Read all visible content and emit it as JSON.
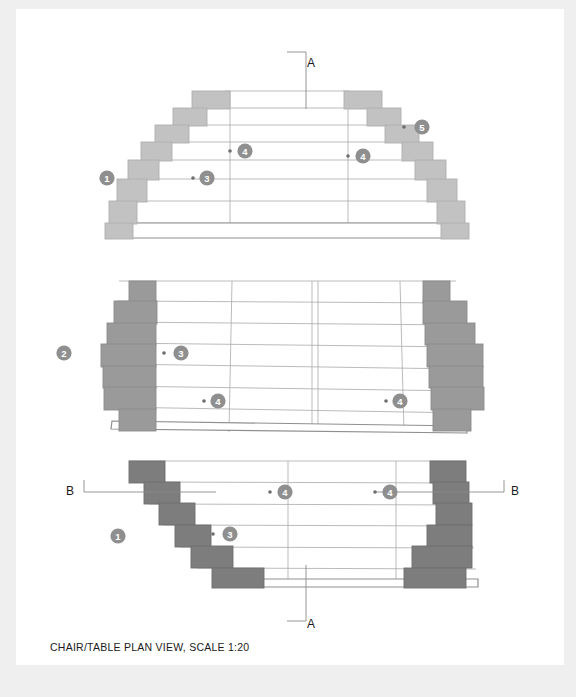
{
  "document": {
    "caption": "CHAIR/TABLE PLAN VIEW, SCALE 1:20",
    "background_color": "#efefef",
    "sheet_color": "#ffffff"
  },
  "section_markers": [
    {
      "label": "A",
      "name": "section-marker-a-top",
      "x": 306,
      "y": 54
    },
    {
      "label": "A",
      "name": "section-marker-a-bottom",
      "x": 306,
      "y": 615
    },
    {
      "label": "B",
      "name": "section-marker-b-left",
      "x": 66,
      "y": 482
    },
    {
      "label": "B",
      "name": "section-marker-b-right",
      "x": 527,
      "y": 482
    }
  ],
  "callouts": [
    {
      "id": "1",
      "name": "callout-1-top",
      "cx": 107,
      "cy": 178,
      "dot": null
    },
    {
      "id": "3",
      "name": "callout-3-top",
      "cx": 207,
      "cy": 178,
      "dot": [
        193,
        178
      ]
    },
    {
      "id": "4",
      "name": "callout-4-top-left",
      "cx": 245,
      "cy": 151,
      "dot": [
        230,
        151
      ]
    },
    {
      "id": "4",
      "name": "callout-4-top-right",
      "cx": 363,
      "cy": 156,
      "dot": [
        348,
        156
      ]
    },
    {
      "id": "5",
      "name": "callout-5-top",
      "cx": 422,
      "cy": 127,
      "dot": [
        404,
        127
      ]
    },
    {
      "id": "2",
      "name": "callout-2-middle",
      "cx": 64,
      "cy": 353,
      "dot": null
    },
    {
      "id": "3",
      "name": "callout-3-middle",
      "cx": 181,
      "cy": 353,
      "dot": [
        164,
        353
      ]
    },
    {
      "id": "4",
      "name": "callout-4-middle-left",
      "cx": 218,
      "cy": 401,
      "dot": [
        204,
        401
      ]
    },
    {
      "id": "4",
      "name": "callout-4-middle-right",
      "cx": 400,
      "cy": 401,
      "dot": [
        386,
        401
      ]
    },
    {
      "id": "1",
      "name": "callout-1-bottom",
      "cx": 118,
      "cy": 536,
      "dot": null
    },
    {
      "id": "3",
      "name": "callout-3-bottom",
      "cx": 230,
      "cy": 534,
      "dot": [
        213,
        534
      ]
    },
    {
      "id": "4",
      "name": "callout-4-bottom-left",
      "cx": 285,
      "cy": 492,
      "dot": [
        270,
        492
      ]
    },
    {
      "id": "4",
      "name": "callout-4-bottom-right",
      "cx": 390,
      "cy": 492,
      "dot": [
        375,
        492
      ]
    }
  ],
  "colors": {
    "badge_fill": "#8f8f8f",
    "badge_text": "#ffffff",
    "outline": "#8c8c8c",
    "hairline": "#a8a8a8",
    "step_light": "#c2c2c2",
    "step_light_stroke": "#b0b0b0",
    "step_mid": "#9a9a9a",
    "step_mid_stroke": "#8c8c8c",
    "step_dark": "#7d7d7d",
    "step_dark_stroke": "#6f6f6f",
    "marker_line": "#8a8a8a",
    "text": "#1b1b1b"
  },
  "views": {
    "top": {
      "name": "plan-view-top",
      "shape": "stepped-trapezoid-wide-bottom",
      "center_lines_x": [
        230,
        348
      ],
      "row_count": 7,
      "steps": [
        {
          "x": 192,
          "y": 91,
          "w": 38,
          "h": 17
        },
        {
          "x": 169,
          "y": 108,
          "w": 23,
          "h": 17
        },
        {
          "x": 151,
          "y": 125,
          "w": 18,
          "h": 16
        },
        {
          "x": 133,
          "y": 141,
          "w": 18,
          "h": 19
        },
        {
          "x": 125,
          "y": 160,
          "w": 12,
          "h": 19
        },
        {
          "x": 115,
          "y": 179,
          "w": 14,
          "h": 23
        },
        {
          "x": 108,
          "y": 202,
          "w": 12,
          "h": 22
        },
        {
          "x": 348,
          "y": 91,
          "w": 38,
          "h": 17
        },
        {
          "x": 386,
          "y": 108,
          "w": 23,
          "h": 17
        },
        {
          "x": 409,
          "y": 125,
          "w": 18,
          "h": 16
        },
        {
          "x": 427,
          "y": 141,
          "w": 18,
          "h": 19
        },
        {
          "x": 441,
          "y": 160,
          "w": 12,
          "h": 19
        },
        {
          "x": 449,
          "y": 179,
          "w": 14,
          "h": 23
        },
        {
          "x": 458,
          "y": 202,
          "w": 12,
          "h": 22
        }
      ]
    },
    "middle": {
      "name": "plan-view-middle",
      "shape": "stepped-rectangle-tapered",
      "center_lines_x": [
        298,
        302
      ],
      "row_count": 7
    },
    "bottom": {
      "name": "plan-view-bottom",
      "shape": "stepped-trapezoid-narrow-bottom",
      "center_lines_x": [
        272,
        380
      ],
      "row_count": 7
    }
  }
}
